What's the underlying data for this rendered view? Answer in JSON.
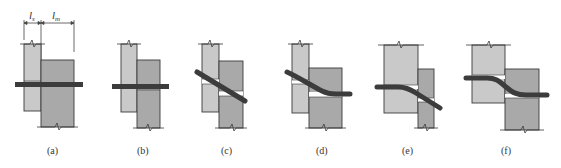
{
  "figure": {
    "colors": {
      "plate_light": "#c9c9c9",
      "plate_dark": "#a9a9a9",
      "outline": "#3a3a3a",
      "bolt": "#3c3c3c",
      "gap": "#ffffff",
      "text": "#333333"
    },
    "dimensions": {
      "ls_label": "l",
      "ls_sub": "s",
      "lm_label": "l",
      "lm_sub": "m"
    },
    "panels": [
      {
        "id": "a",
        "label": "(a)",
        "description": "Bolt through single-shear lap joint, undeformed"
      },
      {
        "id": "b",
        "label": "(b)",
        "description": "Plates slip; bolt bears on hole sides"
      },
      {
        "id": "c",
        "label": "(c)",
        "description": "Rigid bolt rotation"
      },
      {
        "id": "d",
        "label": "(d)",
        "description": "Bolt bending in thin plate, fixed in thick plate"
      },
      {
        "id": "e",
        "label": "(e)",
        "description": "Bolt bending in thin member, thick member fixed"
      },
      {
        "id": "f",
        "label": "(f)",
        "description": "Double-curvature bolt bending in equal plates"
      }
    ]
  }
}
